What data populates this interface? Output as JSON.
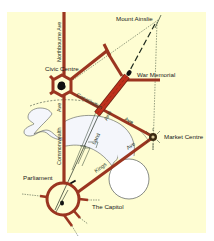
{
  "map": {
    "title": "Canberra Parliamentary Triangle",
    "colors": {
      "page_background": "#ffffff",
      "map_background": "#fefdd2",
      "road": "#9b3520",
      "road_outline": "#6e2414",
      "anzac_road": "#c0301c",
      "lake_fill": "#f4f6fb",
      "lake_outline": "#555a58",
      "axis_line": "#2c3e2c",
      "label": "#1a1a1a"
    },
    "places": {
      "mount_ainslie": "Mount Ainslie",
      "war_memorial": "War Memorial",
      "civic_centre": "Civic Centre",
      "market_centre": "Market Centre",
      "parliament": "Parliament",
      "the_capitol": "The Capitol"
    },
    "roads": {
      "northbourne": "Northbourne Ave",
      "commonwealth_ave": "Ave",
      "commonwealth": "Commonwealth",
      "constitution": "Constitution",
      "constitution_ave": "Ave",
      "kings": "Kings",
      "kings_ave": "Ave",
      "land": "Land",
      "land_axis": "Axis"
    }
  }
}
